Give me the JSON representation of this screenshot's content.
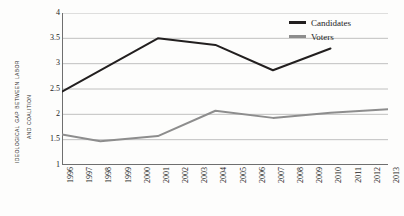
{
  "chart_data": {
    "type": "line",
    "title": "",
    "xlabel": "",
    "ylabel": "Ideological gap between Labor and Coalition",
    "ylabel_line1": "Ideological gap between Labor",
    "ylabel_line2": "and Coalition",
    "x": [
      1996,
      1997,
      1998,
      1999,
      2000,
      2001,
      2002,
      2003,
      2004,
      2005,
      2006,
      2007,
      2008,
      2009,
      2010,
      2011,
      2012,
      2013
    ],
    "categories": [
      "1996",
      "1997",
      "1998",
      "1999",
      "2000",
      "2001",
      "2002",
      "2003",
      "2004",
      "2005",
      "2006",
      "2007",
      "2008",
      "2009",
      "2010",
      "2011",
      "2012",
      "2013"
    ],
    "xlim": [
      1996,
      2013
    ],
    "ylim": [
      1,
      4
    ],
    "yticks": [
      4,
      3.5,
      3,
      2.5,
      2,
      1.5,
      1
    ],
    "ytick_labels": [
      "4",
      "3.5",
      "3",
      "2.5",
      "2",
      "1.5",
      "1"
    ],
    "grid": "horizontal",
    "legend_position": "top-right",
    "series": [
      {
        "name": "Candidates",
        "color": "#221f1f",
        "x": [
          1996,
          2001,
          2004,
          2007,
          2010
        ],
        "values": [
          2.45,
          3.5,
          3.37,
          2.87,
          3.3
        ]
      },
      {
        "name": "Voters",
        "color": "#8d8d8d",
        "x": [
          1996,
          1998,
          2001,
          2004,
          2007,
          2010,
          2013
        ],
        "values": [
          1.6,
          1.47,
          1.57,
          2.07,
          1.93,
          2.03,
          2.1
        ]
      }
    ]
  },
  "legend": {
    "items": [
      {
        "label": "Candidates",
        "color": "#221f1f"
      },
      {
        "label": "Voters",
        "color": "#8d8d8d"
      }
    ]
  },
  "colors": {
    "candidates": "#221f1f",
    "voters": "#8d8d8d",
    "grid": "#b9b9b9",
    "axis": "#6f6f6f",
    "background": "#fdfdfc"
  }
}
